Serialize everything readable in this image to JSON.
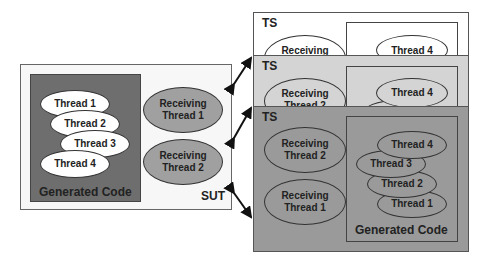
{
  "sut": {
    "label": "SUT",
    "generated_code_label": "Generated Code",
    "threads": [
      "Thread 1",
      "Thread 2",
      "Thread 3",
      "Thread 4"
    ],
    "receiving_threads": [
      "Receiving\nThread 1",
      "Receiving\nThread 2"
    ]
  },
  "ts_back": {
    "label": "TS",
    "receiving": "Receiving",
    "thread": "Thread 4"
  },
  "ts_middle": {
    "label": "TS",
    "receiving": "Receiving\nThread 2",
    "thread": "Thread 4"
  },
  "ts_front": {
    "label": "TS",
    "generated_code_label": "Generated Code",
    "receiving_threads": [
      "Receiving\nThread 2",
      "Receiving\nThread 1"
    ],
    "threads": [
      "Thread 4",
      "Thread 3",
      "Thread 2",
      "Thread 1"
    ]
  },
  "colors": {
    "sut_bg": "#f7f7f7",
    "generated_code_bg": "#6e6e6e",
    "receiving_ellipse": "#a0a0a0",
    "ts_back_bg": "#ffffff",
    "ts_middle_bg": "#d4d4d4",
    "ts_front_bg": "#9a9a9a"
  }
}
